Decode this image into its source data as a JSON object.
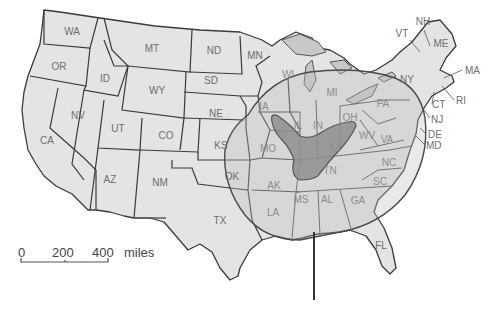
{
  "map": {
    "title": "",
    "colors": {
      "state_fill": "#e4e4e4",
      "state_inside_circle_fill": "#cfcfcf",
      "shaded_zone_fill": "#8e8e8e",
      "border": "#3a3a3a",
      "label": "#6e6e6e"
    },
    "states": [
      {
        "abbr": "WA",
        "x": 72,
        "y": 32
      },
      {
        "abbr": "OR",
        "x": 59,
        "y": 67
      },
      {
        "abbr": "ID",
        "x": 105,
        "y": 79
      },
      {
        "abbr": "MT",
        "x": 152,
        "y": 49
      },
      {
        "abbr": "WY",
        "x": 157,
        "y": 91
      },
      {
        "abbr": "ND",
        "x": 214,
        "y": 51
      },
      {
        "abbr": "SD",
        "x": 211,
        "y": 81
      },
      {
        "abbr": "NE",
        "x": 216,
        "y": 114
      },
      {
        "abbr": "MN",
        "x": 255,
        "y": 56
      },
      {
        "abbr": "NV",
        "x": 78,
        "y": 116
      },
      {
        "abbr": "UT",
        "x": 118,
        "y": 129
      },
      {
        "abbr": "CO",
        "x": 166,
        "y": 136
      },
      {
        "abbr": "CA",
        "x": 47,
        "y": 141
      },
      {
        "abbr": "AZ",
        "x": 110,
        "y": 180
      },
      {
        "abbr": "NM",
        "x": 160,
        "y": 183
      },
      {
        "abbr": "KS",
        "x": 221,
        "y": 146
      },
      {
        "abbr": "OK",
        "x": 232,
        "y": 177
      },
      {
        "abbr": "TX",
        "x": 220,
        "y": 221
      },
      {
        "abbr": "IA",
        "x": 264,
        "y": 107
      },
      {
        "abbr": "WI",
        "x": 288,
        "y": 75
      },
      {
        "abbr": "IL",
        "x": 298,
        "y": 126
      },
      {
        "abbr": "MO",
        "x": 268,
        "y": 149
      },
      {
        "abbr": "MI",
        "x": 332,
        "y": 93
      },
      {
        "abbr": "IN",
        "x": 318,
        "y": 126
      },
      {
        "abbr": "OH",
        "x": 350,
        "y": 118
      },
      {
        "abbr": "KY",
        "x": 336,
        "y": 148
      },
      {
        "abbr": "TN",
        "x": 330,
        "y": 171
      },
      {
        "abbr": "AK",
        "x": 274,
        "y": 186
      },
      {
        "abbr": "LA",
        "x": 273,
        "y": 213
      },
      {
        "abbr": "MS",
        "x": 301,
        "y": 200
      },
      {
        "abbr": "AL",
        "x": 327,
        "y": 200
      },
      {
        "abbr": "GA",
        "x": 358,
        "y": 201
      },
      {
        "abbr": "SC",
        "x": 380,
        "y": 182
      },
      {
        "abbr": "NC",
        "x": 389,
        "y": 163
      },
      {
        "abbr": "VA",
        "x": 387,
        "y": 140
      },
      {
        "abbr": "WV",
        "x": 367,
        "y": 136
      },
      {
        "abbr": "PA",
        "x": 383,
        "y": 104
      },
      {
        "abbr": "NY",
        "x": 407,
        "y": 80
      },
      {
        "abbr": "ME",
        "x": 441,
        "y": 44
      },
      {
        "abbr": "FL",
        "x": 381,
        "y": 246
      }
    ],
    "callout_labels": [
      {
        "abbr": "VT",
        "x": 394,
        "y": 36
      },
      {
        "abbr": "NH",
        "x": 414,
        "y": 24
      },
      {
        "abbr": "MA",
        "x": 465,
        "y": 73
      },
      {
        "abbr": "RI",
        "x": 456,
        "y": 103
      },
      {
        "abbr": "CT",
        "x": 432,
        "y": 107
      },
      {
        "abbr": "NJ",
        "x": 431,
        "y": 122
      },
      {
        "abbr": "DE",
        "x": 428,
        "y": 138
      },
      {
        "abbr": "MD",
        "x": 426,
        "y": 148
      }
    ],
    "scale_bar": {
      "ticks": [
        "0",
        "200",
        "400"
      ],
      "unit": "miles"
    }
  }
}
